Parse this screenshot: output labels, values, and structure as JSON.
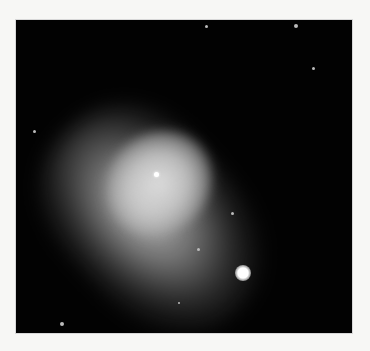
{
  "image": {
    "subject": "planetary nebula",
    "background_color": "#020202",
    "page_color": "#f7f7f5",
    "frame": {
      "x": 15,
      "y": 19,
      "width": 338,
      "height": 315
    }
  },
  "stars": [
    {
      "x": 205,
      "y": 25,
      "r": 1.5
    },
    {
      "x": 295,
      "y": 25,
      "r": 2
    },
    {
      "x": 312,
      "y": 67,
      "r": 1.5
    },
    {
      "x": 33,
      "y": 130,
      "r": 1.5
    },
    {
      "x": 231,
      "y": 212,
      "r": 1.5
    },
    {
      "x": 197,
      "y": 248,
      "r": 1.5
    },
    {
      "x": 178,
      "y": 302,
      "r": 1
    },
    {
      "x": 61,
      "y": 323,
      "r": 2
    }
  ],
  "central_star": {
    "x": 155,
    "y": 173
  },
  "bright_star": {
    "x": 242,
    "y": 272,
    "r": 8
  }
}
